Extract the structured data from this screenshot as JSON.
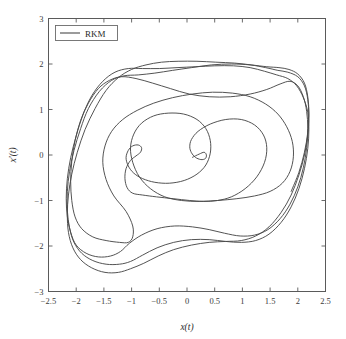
{
  "figure": {
    "background_color": "#ffffff",
    "frame_color": "#5a5a5a",
    "line_color": "#4a4a4a"
  },
  "chart_data": {
    "type": "line",
    "title": "",
    "subtitle": "",
    "xlabel": "x(t)",
    "ylabel": "x'(t)",
    "xlim": [
      -2.5,
      2.5
    ],
    "ylim": [
      -3,
      3
    ],
    "xticks": [
      -2.5,
      -2,
      -1.5,
      -1,
      -0.5,
      0,
      0.5,
      1,
      1.5,
      2,
      2.5
    ],
    "xticklabels": [
      "−2.5",
      "−2",
      "−1.5",
      "−1",
      "−0.5",
      "0",
      "0.5",
      "1",
      "1.5",
      "2",
      "2.5"
    ],
    "yticks": [
      -3,
      -2,
      -1,
      0,
      1,
      2,
      3
    ],
    "yticklabels": [
      "−3",
      "−2",
      "−1",
      "0",
      "1",
      "2",
      "3"
    ],
    "grid": false,
    "legend_position": "upper-left",
    "legend": [
      {
        "name": "RKM",
        "color": "#4a4a4a",
        "style": "solid"
      }
    ],
    "series": [
      {
        "name": "RKM",
        "points": [
          [
            0.1,
            -0.05
          ],
          [
            0.22,
            0.02
          ],
          [
            0.31,
            0.06
          ],
          [
            0.35,
            0.0
          ],
          [
            0.33,
            -0.08
          ],
          [
            0.25,
            -0.1
          ],
          [
            0.15,
            -0.05
          ],
          [
            0.08,
            0.05
          ],
          [
            0.05,
            0.18
          ],
          [
            0.08,
            0.34
          ],
          [
            0.2,
            0.52
          ],
          [
            0.42,
            0.68
          ],
          [
            0.7,
            0.78
          ],
          [
            0.98,
            0.78
          ],
          [
            1.22,
            0.66
          ],
          [
            1.38,
            0.44
          ],
          [
            1.44,
            0.16
          ],
          [
            1.4,
            -0.16
          ],
          [
            1.26,
            -0.48
          ],
          [
            1.05,
            -0.74
          ],
          [
            0.8,
            -0.92
          ],
          [
            0.55,
            -1.0
          ],
          [
            0.3,
            -1.02
          ],
          [
            0.05,
            -1.0
          ],
          [
            -0.25,
            -0.96
          ],
          [
            -0.55,
            -0.92
          ],
          [
            -0.8,
            -0.88
          ],
          [
            -0.98,
            -0.84
          ],
          [
            -1.08,
            -0.72
          ],
          [
            -1.12,
            -0.52
          ],
          [
            -1.1,
            -0.3
          ],
          [
            -1.02,
            -0.12
          ],
          [
            -0.92,
            -0.02
          ],
          [
            -0.84,
            0.06
          ],
          [
            -0.82,
            0.16
          ],
          [
            -0.88,
            0.22
          ],
          [
            -0.98,
            0.2
          ],
          [
            -1.06,
            0.1
          ],
          [
            -1.1,
            -0.06
          ],
          [
            -1.06,
            -0.24
          ],
          [
            -0.96,
            -0.4
          ],
          [
            -0.8,
            -0.52
          ],
          [
            -0.58,
            -0.6
          ],
          [
            -0.32,
            -0.62
          ],
          [
            -0.05,
            -0.56
          ],
          [
            0.18,
            -0.42
          ],
          [
            0.34,
            -0.22
          ],
          [
            0.42,
            0.04
          ],
          [
            0.42,
            0.32
          ],
          [
            0.34,
            0.58
          ],
          [
            0.18,
            0.78
          ],
          [
            -0.06,
            0.9
          ],
          [
            -0.34,
            0.92
          ],
          [
            -0.6,
            0.86
          ],
          [
            -0.82,
            0.7
          ],
          [
            -0.96,
            0.46
          ],
          [
            -1.02,
            0.16
          ],
          [
            -0.98,
            -0.16
          ],
          [
            -0.86,
            -0.48
          ],
          [
            -0.66,
            -0.74
          ],
          [
            -0.4,
            -0.92
          ],
          [
            -0.1,
            -1.0
          ],
          [
            0.22,
            -1.02
          ],
          [
            0.55,
            -1.0
          ],
          [
            0.9,
            -0.96
          ],
          [
            1.22,
            -0.9
          ],
          [
            1.5,
            -0.8
          ],
          [
            1.72,
            -0.62
          ],
          [
            1.86,
            -0.36
          ],
          [
            1.92,
            -0.04
          ],
          [
            1.9,
            0.3
          ],
          [
            1.8,
            0.62
          ],
          [
            1.64,
            0.9
          ],
          [
            1.42,
            1.12
          ],
          [
            1.14,
            1.28
          ],
          [
            0.82,
            1.36
          ],
          [
            0.46,
            1.38
          ],
          [
            0.1,
            1.34
          ],
          [
            -0.26,
            1.26
          ],
          [
            -0.6,
            1.14
          ],
          [
            -0.9,
            0.98
          ],
          [
            -1.16,
            0.78
          ],
          [
            -1.36,
            0.52
          ],
          [
            -1.48,
            0.2
          ],
          [
            -1.52,
            -0.16
          ],
          [
            -1.46,
            -0.54
          ],
          [
            -1.32,
            -0.9
          ],
          [
            -1.1,
            -1.24
          ],
          [
            -0.98,
            -1.56
          ],
          [
            -0.98,
            -1.8
          ],
          [
            -1.06,
            -1.92
          ],
          [
            -1.22,
            -1.92
          ],
          [
            -1.46,
            -1.88
          ],
          [
            -1.7,
            -1.8
          ],
          [
            -1.9,
            -1.62
          ],
          [
            -2.02,
            -1.36
          ],
          [
            -2.08,
            -1.0
          ],
          [
            -2.1,
            -0.58
          ],
          [
            -2.08,
            -0.14
          ],
          [
            -2.02,
            0.32
          ],
          [
            -1.92,
            0.76
          ],
          [
            -1.78,
            1.14
          ],
          [
            -1.6,
            1.46
          ],
          [
            -1.4,
            1.64
          ],
          [
            -1.18,
            1.72
          ],
          [
            -0.92,
            1.68
          ],
          [
            -0.62,
            1.58
          ],
          [
            -0.3,
            1.46
          ],
          [
            0.04,
            1.34
          ],
          [
            0.4,
            1.28
          ],
          [
            0.78,
            1.28
          ],
          [
            1.14,
            1.34
          ],
          [
            1.44,
            1.44
          ],
          [
            1.68,
            1.56
          ],
          [
            1.86,
            1.62
          ],
          [
            2.0,
            1.52
          ],
          [
            2.1,
            1.28
          ],
          [
            2.16,
            0.96
          ],
          [
            2.18,
            0.58
          ],
          [
            2.16,
            0.16
          ],
          [
            2.1,
            -0.28
          ],
          [
            2.0,
            -0.7
          ],
          [
            1.86,
            -1.08
          ],
          [
            1.68,
            -1.4
          ],
          [
            1.46,
            -1.64
          ],
          [
            1.22,
            -1.76
          ],
          [
            0.96,
            -1.78
          ],
          [
            0.68,
            -1.72
          ],
          [
            0.4,
            -1.64
          ],
          [
            0.1,
            -1.58
          ],
          [
            -0.22,
            -1.56
          ],
          [
            -0.54,
            -1.62
          ],
          [
            -0.82,
            -1.76
          ],
          [
            -1.04,
            -1.94
          ],
          [
            -1.2,
            -2.12
          ],
          [
            -1.38,
            -2.22
          ],
          [
            -1.6,
            -2.24
          ],
          [
            -1.82,
            -2.16
          ],
          [
            -2.0,
            -1.98
          ],
          [
            -2.1,
            -1.7
          ],
          [
            -2.16,
            -1.36
          ],
          [
            -2.18,
            -0.96
          ],
          [
            -2.16,
            -0.52
          ],
          [
            -2.1,
            -0.06
          ],
          [
            -2.0,
            0.42
          ],
          [
            -1.88,
            0.88
          ],
          [
            -1.72,
            1.3
          ],
          [
            -1.52,
            1.62
          ],
          [
            -1.3,
            1.82
          ],
          [
            -1.06,
            1.9
          ],
          [
            -0.8,
            1.9
          ],
          [
            -0.5,
            1.9
          ],
          [
            -0.18,
            1.92
          ],
          [
            0.16,
            1.94
          ],
          [
            0.5,
            1.96
          ],
          [
            0.84,
            1.96
          ],
          [
            1.14,
            1.92
          ],
          [
            1.4,
            1.84
          ],
          [
            1.62,
            1.76
          ],
          [
            1.82,
            1.68
          ],
          [
            1.98,
            1.52
          ],
          [
            2.1,
            1.26
          ],
          [
            2.18,
            0.94
          ],
          [
            2.2,
            0.56
          ],
          [
            2.18,
            0.14
          ],
          [
            2.12,
            -0.3
          ],
          [
            2.02,
            -0.74
          ],
          [
            1.88,
            -1.14
          ],
          [
            1.7,
            -1.48
          ],
          [
            1.48,
            -1.74
          ],
          [
            1.24,
            -1.88
          ],
          [
            0.98,
            -1.92
          ],
          [
            0.7,
            -1.9
          ],
          [
            0.4,
            -1.86
          ],
          [
            0.08,
            -1.86
          ],
          [
            -0.24,
            -1.92
          ],
          [
            -0.54,
            -2.04
          ],
          [
            -0.8,
            -2.2
          ],
          [
            -1.02,
            -2.34
          ],
          [
            -1.22,
            -2.4
          ],
          [
            -1.46,
            -2.4
          ],
          [
            -1.7,
            -2.32
          ],
          [
            -1.9,
            -2.16
          ],
          [
            -2.04,
            -1.92
          ],
          [
            -2.12,
            -1.6
          ],
          [
            -2.16,
            -1.22
          ],
          [
            -2.16,
            -0.8
          ],
          [
            -2.12,
            -0.36
          ],
          [
            -2.04,
            0.1
          ],
          [
            -1.92,
            0.58
          ],
          [
            -1.78,
            1.02
          ],
          [
            -1.58,
            1.4
          ],
          [
            -1.36,
            1.64
          ],
          [
            -1.14,
            1.74
          ],
          [
            -0.88,
            1.76
          ],
          [
            -0.58,
            1.8
          ],
          [
            -0.26,
            1.86
          ],
          [
            0.08,
            1.92
          ],
          [
            0.44,
            1.98
          ],
          [
            0.8,
            2.0
          ],
          [
            1.14,
            1.98
          ],
          [
            1.42,
            1.92
          ],
          [
            1.64,
            1.86
          ],
          [
            1.82,
            1.82
          ],
          [
            2.0,
            1.72
          ],
          [
            2.12,
            1.52
          ],
          [
            2.18,
            1.22
          ],
          [
            2.2,
            0.86
          ],
          [
            2.18,
            0.44
          ],
          [
            2.12,
            0.0
          ],
          [
            2.02,
            -0.44
          ],
          [
            1.88,
            -0.88
          ],
          [
            1.7,
            -1.26
          ],
          [
            1.48,
            -1.58
          ],
          [
            1.24,
            -1.78
          ],
          [
            0.98,
            -1.88
          ],
          [
            0.7,
            -1.9
          ],
          [
            0.4,
            -1.92
          ],
          [
            0.08,
            -1.98
          ],
          [
            -0.24,
            -2.08
          ],
          [
            -0.52,
            -2.22
          ],
          [
            -0.78,
            -2.38
          ],
          [
            -1.02,
            -2.5
          ],
          [
            -1.24,
            -2.58
          ],
          [
            -1.48,
            -2.58
          ],
          [
            -1.72,
            -2.48
          ],
          [
            -1.92,
            -2.3
          ],
          [
            -2.06,
            -2.04
          ],
          [
            -2.14,
            -1.7
          ],
          [
            -2.16,
            -1.3
          ],
          [
            -2.14,
            -0.88
          ],
          [
            -2.08,
            -0.42
          ],
          [
            -1.98,
            0.06
          ],
          [
            -1.84,
            0.56
          ],
          [
            -1.66,
            1.02
          ],
          [
            -1.46,
            1.42
          ],
          [
            -1.24,
            1.7
          ],
          [
            -1.0,
            1.88
          ],
          [
            -0.74,
            1.98
          ],
          [
            -0.46,
            2.04
          ],
          [
            -0.16,
            2.06
          ],
          [
            0.18,
            2.06
          ],
          [
            0.52,
            2.04
          ],
          [
            0.86,
            2.02
          ],
          [
            1.16,
            1.98
          ],
          [
            1.44,
            1.94
          ],
          [
            1.66,
            1.92
          ],
          [
            1.84,
            1.88
          ],
          [
            2.0,
            1.78
          ],
          [
            2.12,
            1.58
          ],
          [
            2.18,
            1.28
          ],
          [
            2.2,
            0.92
          ],
          [
            2.18,
            0.5
          ],
          [
            2.12,
            0.06
          ],
          [
            2.02,
            -0.38
          ],
          [
            1.88,
            -0.8
          ]
        ]
      }
    ]
  },
  "legend_label": "RKM"
}
